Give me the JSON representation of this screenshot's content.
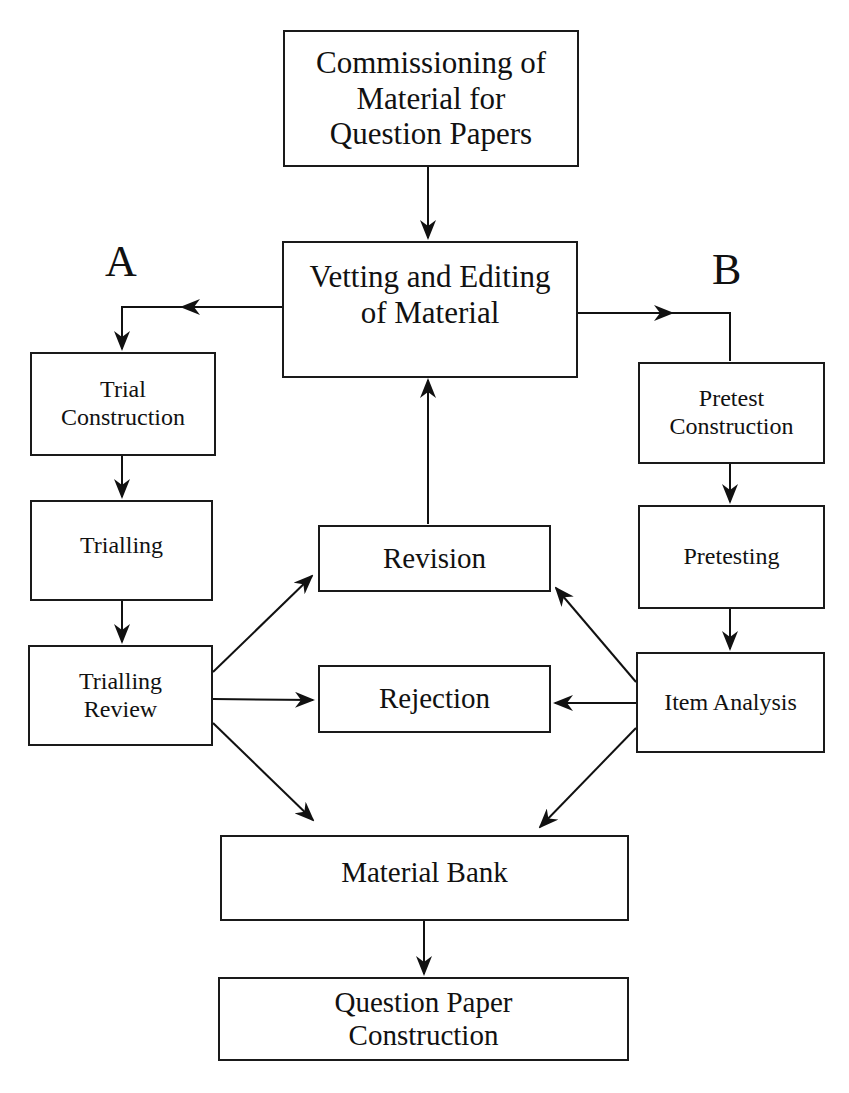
{
  "diagram": {
    "labels": {
      "a": "A",
      "b": "B"
    },
    "nodes": {
      "commissioning": "Commissioning of\nMaterial for\nQuestion Papers",
      "vetting": "Vetting and Editing\nof Material",
      "trial_construction": "Trial\nConstruction",
      "trialling": "Trialling",
      "trialling_review": "Trialling\nReview",
      "pretest_construction": "Pretest\nConstruction",
      "pretesting": "Pretesting",
      "item_analysis": "Item Analysis",
      "revision": "Revision",
      "rejection": "Rejection",
      "material_bank": "Material Bank",
      "question_paper": "Question Paper\nConstruction"
    },
    "edges": [
      {
        "from": "commissioning",
        "to": "vetting"
      },
      {
        "from": "vetting",
        "to": "trial_construction",
        "branch": "A"
      },
      {
        "from": "vetting",
        "to": "pretest_construction",
        "branch": "B"
      },
      {
        "from": "trial_construction",
        "to": "trialling"
      },
      {
        "from": "trialling",
        "to": "trialling_review"
      },
      {
        "from": "pretest_construction",
        "to": "pretesting"
      },
      {
        "from": "pretesting",
        "to": "item_analysis"
      },
      {
        "from": "trialling_review",
        "to": "revision"
      },
      {
        "from": "trialling_review",
        "to": "rejection"
      },
      {
        "from": "trialling_review",
        "to": "material_bank"
      },
      {
        "from": "item_analysis",
        "to": "revision"
      },
      {
        "from": "item_analysis",
        "to": "rejection"
      },
      {
        "from": "item_analysis",
        "to": "material_bank"
      },
      {
        "from": "revision",
        "to": "vetting"
      },
      {
        "from": "material_bank",
        "to": "question_paper"
      }
    ]
  }
}
